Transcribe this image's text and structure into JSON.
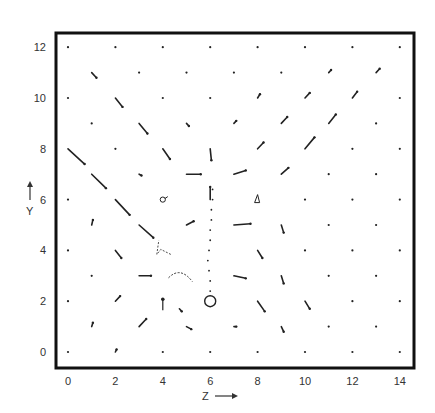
{
  "chart_data": {
    "type": "scatter",
    "subtype": "vector-field",
    "title": "",
    "xlabel": "Z",
    "ylabel": "Y",
    "xlim": [
      -0.5,
      14.5
    ],
    "ylim": [
      -0.6,
      12.6
    ],
    "x_ticks": [
      "0",
      "2",
      "4",
      "6",
      "8",
      "10",
      "12",
      "14"
    ],
    "y_ticks": [
      "0",
      "2",
      "4",
      "6",
      "8",
      "10",
      "12"
    ],
    "grid": false,
    "legend": null,
    "source_marker": {
      "z": 6,
      "y": 2,
      "shape": "open-circle"
    },
    "trail": {
      "description": "dotted vertical trail rising from source circle",
      "points": [
        [
          6,
          2.4
        ],
        [
          6,
          2.8
        ],
        [
          5.95,
          3.2
        ],
        [
          5.9,
          3.6
        ],
        [
          5.95,
          4.0
        ],
        [
          6.0,
          4.4
        ],
        [
          6.0,
          4.8
        ],
        [
          6.05,
          5.2
        ],
        [
          6.05,
          5.6
        ],
        [
          6.1,
          6.0
        ],
        [
          6.1,
          6.4
        ]
      ]
    },
    "vectors": [
      {
        "z": 0,
        "y": 12,
        "dz": 0,
        "dy": 0
      },
      {
        "z": 2,
        "y": 12,
        "dz": 0,
        "dy": 0
      },
      {
        "z": 4,
        "y": 12,
        "dz": 0,
        "dy": 0
      },
      {
        "z": 6,
        "y": 12,
        "dz": 0,
        "dy": 0
      },
      {
        "z": 8,
        "y": 12,
        "dz": 0,
        "dy": 0
      },
      {
        "z": 10,
        "y": 12,
        "dz": 0,
        "dy": 0
      },
      {
        "z": 12,
        "y": 12,
        "dz": 0,
        "dy": 0
      },
      {
        "z": 14,
        "y": 12,
        "dz": 0,
        "dy": 0
      },
      {
        "z": 1,
        "y": 11,
        "dz": 0.2,
        "dy": -0.2
      },
      {
        "z": 3,
        "y": 11,
        "dz": 0,
        "dy": 0
      },
      {
        "z": 5,
        "y": 11,
        "dz": 0,
        "dy": 0
      },
      {
        "z": 7,
        "y": 11,
        "dz": 0,
        "dy": 0
      },
      {
        "z": 9,
        "y": 11,
        "dz": 0,
        "dy": 0
      },
      {
        "z": 11,
        "y": 11,
        "dz": 0.1,
        "dy": 0.1
      },
      {
        "z": 13,
        "y": 11,
        "dz": 0.15,
        "dy": 0.15
      },
      {
        "z": 0,
        "y": 10,
        "dz": 0,
        "dy": 0
      },
      {
        "z": 2,
        "y": 10,
        "dz": 0.3,
        "dy": -0.35
      },
      {
        "z": 4,
        "y": 10,
        "dz": 0,
        "dy": 0
      },
      {
        "z": 6,
        "y": 10,
        "dz": 0,
        "dy": 0
      },
      {
        "z": 8,
        "y": 10,
        "dz": 0.1,
        "dy": 0.15
      },
      {
        "z": 10,
        "y": 10,
        "dz": 0.2,
        "dy": 0.2
      },
      {
        "z": 12,
        "y": 10,
        "dz": 0.2,
        "dy": 0.25
      },
      {
        "z": 14,
        "y": 10,
        "dz": 0,
        "dy": 0
      },
      {
        "z": 1,
        "y": 9,
        "dz": 0,
        "dy": 0
      },
      {
        "z": 3,
        "y": 9,
        "dz": 0.35,
        "dy": -0.4
      },
      {
        "z": 5,
        "y": 9,
        "dz": 0.1,
        "dy": -0.1
      },
      {
        "z": 7,
        "y": 9,
        "dz": 0.1,
        "dy": 0.1
      },
      {
        "z": 9,
        "y": 9,
        "dz": 0.25,
        "dy": 0.25
      },
      {
        "z": 11,
        "y": 9,
        "dz": 0.3,
        "dy": 0.35
      },
      {
        "z": 13,
        "y": 9,
        "dz": 0,
        "dy": 0
      },
      {
        "z": 0,
        "y": 8,
        "dz": 0.7,
        "dy": -0.6
      },
      {
        "z": 2,
        "y": 8,
        "dz": 0,
        "dy": 0
      },
      {
        "z": 4,
        "y": 8,
        "dz": 0.3,
        "dy": -0.4
      },
      {
        "z": 6,
        "y": 8,
        "dz": 0.05,
        "dy": -0.45
      },
      {
        "z": 8,
        "y": 8,
        "dz": 0.25,
        "dy": 0.25
      },
      {
        "z": 10,
        "y": 8,
        "dz": 0.4,
        "dy": 0.45
      },
      {
        "z": 12,
        "y": 8,
        "dz": 0,
        "dy": 0
      },
      {
        "z": 14,
        "y": 8,
        "dz": 0,
        "dy": 0
      },
      {
        "z": 1,
        "y": 7,
        "dz": 0.6,
        "dy": -0.55
      },
      {
        "z": 3,
        "y": 7,
        "dz": 0.1,
        "dy": -0.05
      },
      {
        "z": 5,
        "y": 7,
        "dz": 0.6,
        "dy": 0.0
      },
      {
        "z": 7,
        "y": 7,
        "dz": 0.5,
        "dy": 0.15
      },
      {
        "z": 9,
        "y": 7,
        "dz": 0.3,
        "dy": 0.25
      },
      {
        "z": 11,
        "y": 7,
        "dz": 0,
        "dy": 0
      },
      {
        "z": 13,
        "y": 7,
        "dz": 0,
        "dy": 0
      },
      {
        "z": 0,
        "y": 6,
        "dz": 0,
        "dy": 0
      },
      {
        "z": 2,
        "y": 6,
        "dz": 0.6,
        "dy": -0.6
      },
      {
        "z": 4,
        "y": 6,
        "dz": 0.2,
        "dy": 0.1,
        "mark": "loop"
      },
      {
        "z": 6,
        "y": 6,
        "dz": 0,
        "dy": 0.5
      },
      {
        "z": 8,
        "y": 6,
        "dz": 0.1,
        "dy": 0.3,
        "mark": "triangle"
      },
      {
        "z": 10,
        "y": 6,
        "dz": 0,
        "dy": 0
      },
      {
        "z": 12,
        "y": 6,
        "dz": 0,
        "dy": 0
      },
      {
        "z": 14,
        "y": 6,
        "dz": 0,
        "dy": 0
      },
      {
        "z": 1,
        "y": 5,
        "dz": 0.05,
        "dy": 0.2
      },
      {
        "z": 3,
        "y": 5,
        "dz": 0.6,
        "dy": -0.5
      },
      {
        "z": 5,
        "y": 5,
        "dz": 0.3,
        "dy": 0.15
      },
      {
        "z": 7,
        "y": 5,
        "dz": 0.7,
        "dy": 0.05
      },
      {
        "z": 9,
        "y": 5,
        "dz": 0.1,
        "dy": -0.3
      },
      {
        "z": 11,
        "y": 5,
        "dz": 0,
        "dy": 0
      },
      {
        "z": 13,
        "y": 5,
        "dz": 0,
        "dy": 0
      },
      {
        "z": 0,
        "y": 4,
        "dz": 0,
        "dy": 0
      },
      {
        "z": 2,
        "y": 4,
        "dz": 0.25,
        "dy": -0.3
      },
      {
        "z": 4,
        "y": 4,
        "dz": -0.3,
        "dy": 0.5,
        "mark": "hook"
      },
      {
        "z": 8,
        "y": 4,
        "dz": 0.2,
        "dy": -0.3
      },
      {
        "z": 10,
        "y": 4,
        "dz": 0,
        "dy": 0
      },
      {
        "z": 12,
        "y": 4,
        "dz": 0,
        "dy": 0
      },
      {
        "z": 14,
        "y": 4,
        "dz": 0,
        "dy": 0
      },
      {
        "z": 1,
        "y": 3,
        "dz": 0,
        "dy": 0
      },
      {
        "z": 3,
        "y": 3,
        "dz": 0.5,
        "dy": 0.0
      },
      {
        "z": 5,
        "y": 3,
        "dz": -0.8,
        "dy": 0.2,
        "mark": "arc"
      },
      {
        "z": 7,
        "y": 3,
        "dz": 0.5,
        "dy": -0.1
      },
      {
        "z": 9,
        "y": 3,
        "dz": 0.1,
        "dy": -0.3
      },
      {
        "z": 11,
        "y": 3,
        "dz": 0,
        "dy": 0
      },
      {
        "z": 13,
        "y": 3,
        "dz": 0,
        "dy": 0
      },
      {
        "z": 0,
        "y": 2,
        "dz": 0,
        "dy": 0
      },
      {
        "z": 2,
        "y": 2,
        "dz": 0.2,
        "dy": 0.2
      },
      {
        "z": 4,
        "y": 2,
        "dz": 0,
        "dy": -0.6,
        "mark": "stem"
      },
      {
        "z": 4.7,
        "y": 1.7,
        "dz": 0.1,
        "dy": -0.1
      },
      {
        "z": 8,
        "y": 2,
        "dz": 0.3,
        "dy": -0.4
      },
      {
        "z": 10,
        "y": 2,
        "dz": 0.2,
        "dy": -0.3
      },
      {
        "z": 12,
        "y": 2,
        "dz": 0,
        "dy": 0
      },
      {
        "z": 14,
        "y": 2,
        "dz": 0,
        "dy": 0
      },
      {
        "z": 1,
        "y": 1,
        "dz": 0.05,
        "dy": 0.15
      },
      {
        "z": 3,
        "y": 1,
        "dz": 0.3,
        "dy": 0.3
      },
      {
        "z": 5,
        "y": 1,
        "dz": 0.2,
        "dy": -0.1
      },
      {
        "z": 7,
        "y": 1,
        "dz": 0.1,
        "dy": 0
      },
      {
        "z": 9,
        "y": 1,
        "dz": 0.1,
        "dy": -0.2
      },
      {
        "z": 11,
        "y": 1,
        "dz": 0,
        "dy": 0
      },
      {
        "z": 13,
        "y": 1,
        "dz": 0,
        "dy": 0
      },
      {
        "z": 0,
        "y": 0,
        "dz": 0,
        "dy": 0
      },
      {
        "z": 2,
        "y": 0,
        "dz": 0.05,
        "dy": 0.1
      },
      {
        "z": 4,
        "y": 0,
        "dz": 0,
        "dy": 0
      },
      {
        "z": 6,
        "y": 0,
        "dz": 0,
        "dy": 0
      },
      {
        "z": 8,
        "y": 0,
        "dz": 0,
        "dy": 0
      },
      {
        "z": 10,
        "y": 0,
        "dz": 0,
        "dy": 0
      },
      {
        "z": 12,
        "y": 0,
        "dz": 0,
        "dy": 0
      },
      {
        "z": 14,
        "y": 0,
        "dz": 0,
        "dy": 0
      }
    ]
  },
  "axes": {
    "x_label": "Z",
    "x_arrow": "→",
    "y_label": "Y",
    "y_arrow": "↑"
  },
  "colors": {
    "ink": "#222222",
    "frame": "#111111",
    "background": "#ffffff"
  }
}
